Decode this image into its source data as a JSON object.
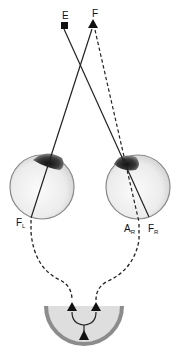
{
  "diagram": {
    "points": {
      "E": {
        "label": "E",
        "shape": "square"
      },
      "F": {
        "label": "F",
        "shape": "triangle"
      }
    },
    "eyes": {
      "left": {
        "fovea_label": "F",
        "fovea_sub": "L"
      },
      "right": {
        "fovea_label": "F",
        "fovea_sub": "R",
        "point_label": "A",
        "point_sub": "R"
      }
    },
    "brain": {
      "shape": "half-circle",
      "arrows": [
        "left-input",
        "right-input",
        "combined-output"
      ]
    },
    "colors": {
      "line": "#222222",
      "eye_fill": "#f2f2f2",
      "eye_outline": "#8a8a8a",
      "iris": "#333333",
      "brain_fill": "#dcdcdc",
      "brain_rim": "#8c8c8c"
    }
  }
}
